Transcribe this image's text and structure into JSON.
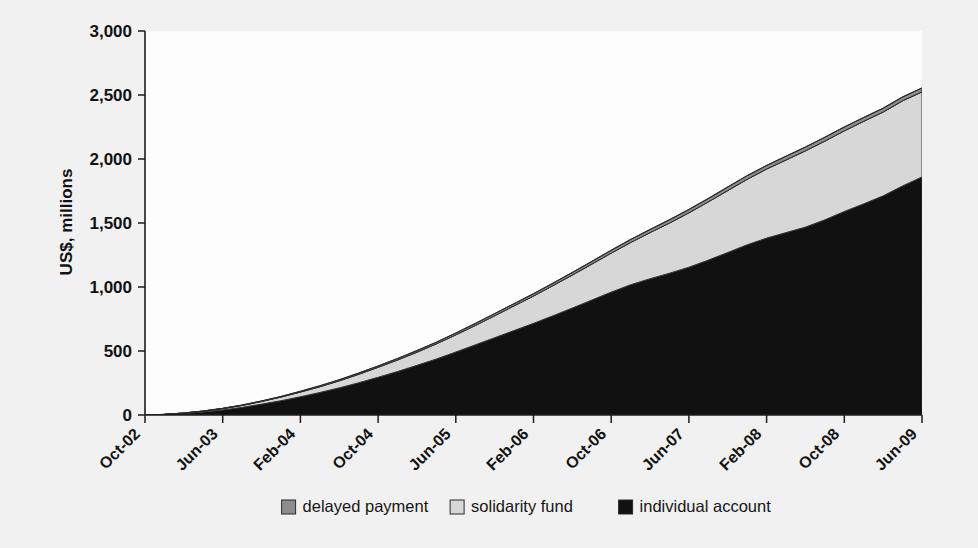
{
  "figure": {
    "background_color": "#f3f3f3",
    "plot_background_color": "#ffffff"
  },
  "axes": {
    "y_axis_title": "US$, millions",
    "y_ticks": [
      "0",
      "500",
      "1,000",
      "1,500",
      "2,000",
      "2,500",
      "3,000"
    ],
    "x_ticks": [
      "Oct-02",
      "Jun-03",
      "Feb-04",
      "Oct-04",
      "Jun-05",
      "Feb-06",
      "Oct-06",
      "Jun-07",
      "Feb-08",
      "Oct-08",
      "Jun-09"
    ]
  },
  "legend": {
    "position": "bottom-center",
    "items": [
      {
        "label": "delayed payment",
        "color": "#8f8f8f"
      },
      {
        "label": "solidarity fund",
        "color": "#d9d9d9"
      },
      {
        "label": "individual account",
        "color": "#111111"
      }
    ]
  },
  "chart_data": {
    "type": "area",
    "stacked": true,
    "title": "",
    "subtitle": "",
    "xlabel": "",
    "ylabel": "US$, millions",
    "ylim": [
      0,
      3000
    ],
    "ytick_step": 500,
    "grid": false,
    "legend_position": "bottom-center",
    "x_tick_labels": [
      "Oct-02",
      "Jun-03",
      "Feb-04",
      "Oct-04",
      "Jun-05",
      "Feb-06",
      "Oct-06",
      "Jun-07",
      "Feb-08",
      "Oct-08",
      "Jun-09"
    ],
    "x_tick_interval_months": 8,
    "x": [
      "Oct-02",
      "Dec-02",
      "Feb-03",
      "Apr-03",
      "Jun-03",
      "Aug-03",
      "Oct-03",
      "Dec-03",
      "Feb-04",
      "Apr-04",
      "Jun-04",
      "Aug-04",
      "Oct-04",
      "Dec-04",
      "Feb-05",
      "Apr-05",
      "Jun-05",
      "Aug-05",
      "Oct-05",
      "Dec-05",
      "Feb-06",
      "Apr-06",
      "Jun-06",
      "Aug-06",
      "Oct-06",
      "Dec-06",
      "Feb-07",
      "Apr-07",
      "Jun-07",
      "Aug-07",
      "Oct-07",
      "Dec-07",
      "Feb-08",
      "Apr-08",
      "Jun-08",
      "Aug-08",
      "Oct-08",
      "Dec-08",
      "Feb-09",
      "Apr-09",
      "Jun-09"
    ],
    "series": [
      {
        "name": "individual account",
        "color": "#111111",
        "values": [
          0,
          4,
          12,
          24,
          40,
          60,
          85,
          112,
          143,
          176,
          212,
          252,
          295,
          340,
          388,
          438,
          492,
          548,
          604,
          660,
          716,
          775,
          836,
          898,
          960,
          1018,
          1065,
          1108,
          1155,
          1210,
          1270,
          1330,
          1382,
          1425,
          1468,
          1525,
          1590,
          1650,
          1712,
          1790,
          1860
        ]
      },
      {
        "name": "solidarity fund",
        "color": "#d9d9d9",
        "values": [
          0,
          1,
          3,
          6,
          10,
          15,
          21,
          28,
          36,
          45,
          55,
          66,
          78,
          90,
          103,
          118,
          134,
          152,
          172,
          193,
          214,
          236,
          258,
          281,
          305,
          330,
          360,
          392,
          425,
          455,
          484,
          512,
          540,
          568,
          596,
          615,
          630,
          645,
          655,
          665,
          665
        ]
      },
      {
        "name": "delayed payment",
        "color": "#8f8f8f",
        "values": [
          0,
          0,
          1,
          1,
          2,
          3,
          4,
          5,
          6,
          7,
          8,
          9,
          10,
          11,
          12,
          13,
          14,
          15,
          16,
          17,
          18,
          19,
          20,
          21,
          22,
          23,
          24,
          25,
          26,
          27,
          27,
          28,
          28,
          29,
          29,
          30,
          30,
          30,
          30,
          30,
          30
        ]
      }
    ],
    "totals_note": {
      "start_total": 0,
      "end_total": 2555
    }
  }
}
